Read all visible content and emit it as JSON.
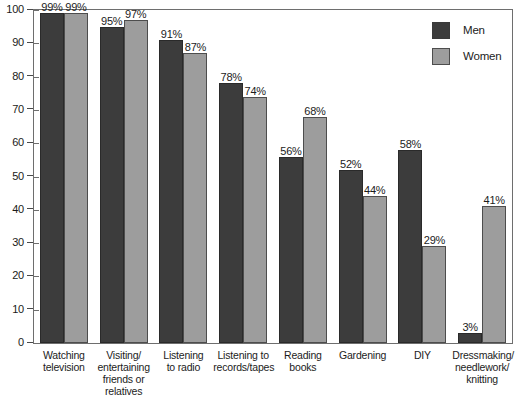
{
  "chart_data": {
    "type": "bar",
    "title": "",
    "xlabel": "",
    "ylabel": "",
    "ylim": [
      0,
      100
    ],
    "yticks": [
      0,
      10,
      20,
      30,
      40,
      50,
      60,
      70,
      80,
      90,
      100
    ],
    "grid": false,
    "legend_position": "top-right",
    "value_suffix": "%",
    "categories": [
      "Watching television",
      "Visiting/ entertaining friends or relatives",
      "Listening to radio",
      "Listening to records/tapes",
      "Reading books",
      "Gardening",
      "DIY",
      "Dressmaking/ needlework/ knitting"
    ],
    "category_lines": [
      [
        "Watching",
        "television"
      ],
      [
        "Visiting/",
        "entertaining",
        "friends or",
        "relatives"
      ],
      [
        "Listening",
        "to radio"
      ],
      [
        "Listening to",
        "records/tapes"
      ],
      [
        "Reading",
        "books"
      ],
      [
        "Gardening"
      ],
      [
        "DIY"
      ],
      [
        "Dressmaking/",
        "needlework/",
        "knitting"
      ]
    ],
    "series": [
      {
        "name": "Men",
        "color": "#3c3c3c",
        "values": [
          99,
          95,
          91,
          78,
          56,
          52,
          58,
          3
        ],
        "labels": [
          "99%",
          "95%",
          "91%",
          "78%",
          "56%",
          "52%",
          "58%",
          "3%"
        ]
      },
      {
        "name": "Women",
        "color": "#9d9d9d",
        "values": [
          99,
          97,
          87,
          74,
          68,
          44,
          29,
          41
        ],
        "labels": [
          "99%",
          "97%",
          "87%",
          "74%",
          "68%",
          "44%",
          "29%",
          "41%"
        ]
      }
    ]
  },
  "legend": {
    "items": [
      {
        "label": "Men",
        "swatch": "men"
      },
      {
        "label": "Women",
        "swatch": "women"
      }
    ]
  },
  "axis": {
    "y_tick_labels": [
      "100",
      "90",
      "80",
      "70",
      "60",
      "50",
      "40",
      "30",
      "20",
      "10",
      "0"
    ]
  }
}
